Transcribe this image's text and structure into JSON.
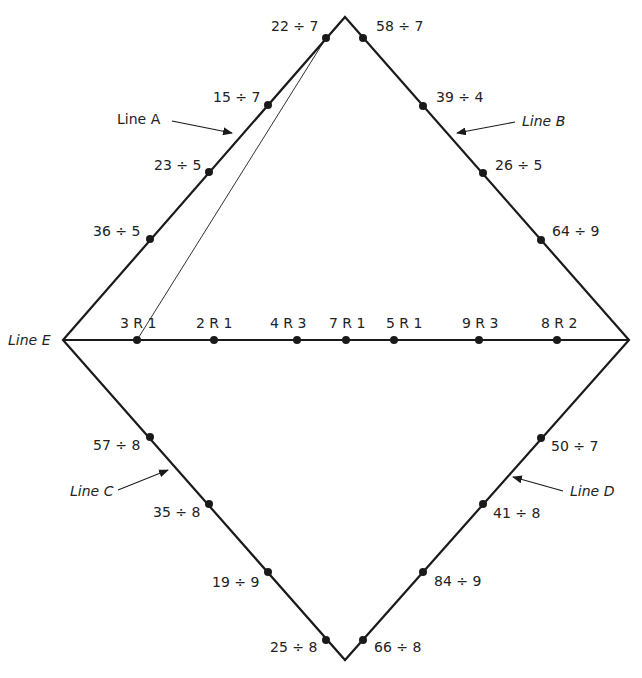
{
  "diagram": {
    "type": "math-division-matching-diamond",
    "stroke_color": "#1a1a1a",
    "vertices": {
      "top": [
        345,
        17
      ],
      "left": [
        63,
        340
      ],
      "right": [
        629,
        340
      ],
      "bottom": [
        345,
        660
      ]
    },
    "line_labels": {
      "A": {
        "text": "Line A",
        "x": 117,
        "y": 124,
        "italic": false,
        "arrow_from": [
          172,
          121
        ],
        "arrow_to": [
          232,
          133
        ]
      },
      "B": {
        "text": "Line B",
        "x": 522,
        "y": 126,
        "italic": true,
        "arrow_from": [
          515,
          122
        ],
        "arrow_to": [
          457,
          133
        ]
      },
      "C": {
        "text": "Line C",
        "x": 70,
        "y": 496,
        "italic": true,
        "arrow_from": [
          118,
          490
        ],
        "arrow_to": [
          168,
          470
        ]
      },
      "D": {
        "text": "Line D",
        "x": 570,
        "y": 496,
        "italic": true,
        "arrow_from": [
          563,
          491
        ],
        "arrow_to": [
          513,
          477
        ]
      },
      "E": {
        "text": "Line E",
        "x": 8,
        "y": 345,
        "italic": true
      }
    },
    "line_a": [
      {
        "label": "22 ÷ 7",
        "dot": [
          326,
          38
        ],
        "tx": 271,
        "ty": 31
      },
      {
        "label": "15 ÷ 7",
        "dot": [
          268,
          105
        ],
        "tx": 213,
        "ty": 102
      },
      {
        "label": "23 ÷ 5",
        "dot": [
          209,
          172
        ],
        "tx": 154,
        "ty": 170
      },
      {
        "label": "36 ÷ 5",
        "dot": [
          150,
          239
        ],
        "tx": 93,
        "ty": 236
      }
    ],
    "line_b": [
      {
        "label": "58 ÷ 7",
        "dot": [
          363,
          38
        ],
        "tx": 376,
        "ty": 31
      },
      {
        "label": "39 ÷ 4",
        "dot": [
          423,
          106
        ],
        "tx": 436,
        "ty": 102
      },
      {
        "label": "26 ÷ 5",
        "dot": [
          483,
          173
        ],
        "tx": 495,
        "ty": 170
      },
      {
        "label": "64 ÷ 9",
        "dot": [
          541,
          240
        ],
        "tx": 552,
        "ty": 236
      }
    ],
    "line_c": [
      {
        "label": "57 ÷ 8",
        "dot": [
          150,
          437
        ],
        "tx": 93,
        "ty": 450
      },
      {
        "label": "35 ÷ 8",
        "dot": [
          209,
          504
        ],
        "tx": 153,
        "ty": 517
      },
      {
        "label": "19 ÷ 9",
        "dot": [
          268,
          572
        ],
        "tx": 212,
        "ty": 587
      },
      {
        "label": "25 ÷ 8",
        "dot": [
          326,
          640
        ],
        "tx": 270,
        "ty": 652
      }
    ],
    "line_d": [
      {
        "label": "50 ÷ 7",
        "dot": [
          541,
          438
        ],
        "tx": 551,
        "ty": 451
      },
      {
        "label": "41 ÷ 8",
        "dot": [
          483,
          504
        ],
        "tx": 493,
        "ty": 518
      },
      {
        "label": "84 ÷ 9",
        "dot": [
          423,
          572
        ],
        "tx": 434,
        "ty": 586
      },
      {
        "label": "66 ÷ 8",
        "dot": [
          363,
          640
        ],
        "tx": 374,
        "ty": 652
      }
    ],
    "line_e": [
      {
        "label": "3 R 1",
        "dot": [
          137,
          340
        ],
        "tx": 120,
        "ty": 328
      },
      {
        "label": "2 R 1",
        "dot": [
          214,
          340
        ],
        "tx": 196,
        "ty": 328
      },
      {
        "label": "4 R 3",
        "dot": [
          297,
          340
        ],
        "tx": 270,
        "ty": 328
      },
      {
        "label": "7 R 1",
        "dot": [
          346,
          340
        ],
        "tx": 329,
        "ty": 328
      },
      {
        "label": "5 R 1",
        "dot": [
          394,
          340
        ],
        "tx": 386,
        "ty": 328
      },
      {
        "label": "9 R 3",
        "dot": [
          479,
          340
        ],
        "tx": 462,
        "ty": 328
      },
      {
        "label": "8 R 2",
        "dot": [
          557,
          340
        ],
        "tx": 541,
        "ty": 328
      }
    ],
    "connector_lines": [
      {
        "from": [
          326,
          38
        ],
        "to": [
          137,
          340
        ],
        "description": "22 ÷ 7 matched to 3 R 1"
      }
    ]
  }
}
